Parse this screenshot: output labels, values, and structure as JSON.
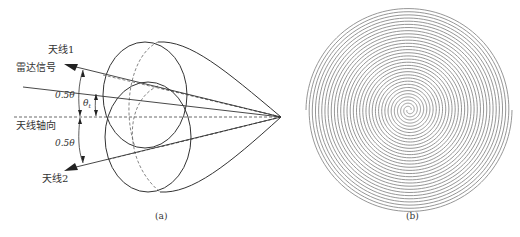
{
  "figure_a": {
    "panel_label": "(a)",
    "labels": {
      "antenna1": "天线1",
      "radar_signal": "雷达信号",
      "angle_upper": "0.5θ",
      "angle_target": "θ",
      "angle_target_sub": "t",
      "antenna_axis": "天线轴向",
      "angle_lower": "0.5θ",
      "antenna2": "天线2"
    }
  },
  "figure_b": {
    "panel_label": "(b)",
    "description": "double-arm Archimedean spiral antenna"
  },
  "colors": {
    "line": "#3a3a3a",
    "dashed": "#555555",
    "spiral": "#8a8a8a",
    "text": "#333333"
  }
}
